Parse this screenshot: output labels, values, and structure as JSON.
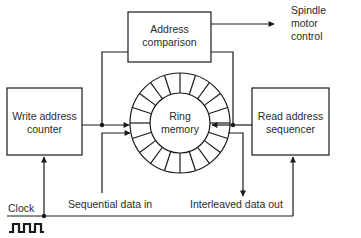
{
  "diagram": {
    "blocks": {
      "address_comparison": {
        "line1": "Address",
        "line2": "comparison"
      },
      "write_counter": {
        "line1": "Write address",
        "line2": "counter"
      },
      "read_sequencer": {
        "line1": "Read address",
        "line2": "sequencer"
      },
      "ring_memory": {
        "line1": "Ring",
        "line2": "memory",
        "segments": 20
      }
    },
    "labels": {
      "spindle": {
        "line1": "Spindle",
        "line2": "motor",
        "line3": "control"
      },
      "clock": "Clock",
      "data_in": "Sequential data in",
      "data_out": "Interleaved data out"
    },
    "colors": {
      "stroke": "#1a1a1a",
      "background": "#ffffff",
      "text": "#2a2a2a"
    }
  }
}
